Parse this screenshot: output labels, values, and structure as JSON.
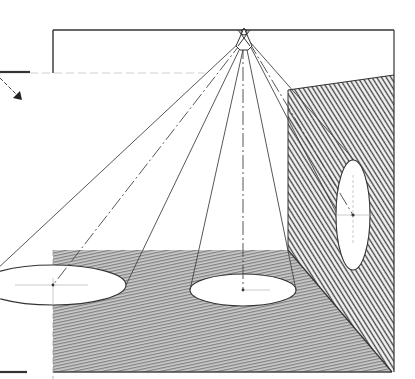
{
  "diagram": {
    "title": "Light cone projection onto floor and wall",
    "kind": "technical-illustration",
    "canvas": {
      "width": 415,
      "height": 379
    },
    "colors": {
      "background": "#ffffff",
      "line": "#3a3a3a",
      "hatch_floor": "#6a6a6a",
      "hatch_wall": "#4a4a4a",
      "spot": "#ffffff"
    },
    "light_source": {
      "x": 243,
      "y": 38,
      "label": ""
    },
    "frame": {
      "ceiling_y": 30,
      "left_x": 53,
      "right_x": 395,
      "ref_line_y": 73
    },
    "floor": {
      "polygon": [
        [
          53,
          250
        ],
        [
          290,
          250
        ],
        [
          392,
          372
        ],
        [
          53,
          372
        ]
      ]
    },
    "wall": {
      "polygon": [
        [
          288,
          90
        ],
        [
          394,
          75
        ],
        [
          394,
          372
        ],
        [
          392,
          372
        ],
        [
          288,
          250
        ]
      ]
    },
    "spots": [
      {
        "name": "floor-spot-left",
        "cx": 53,
        "cy": 285,
        "rx": 73,
        "ry": 20
      },
      {
        "name": "floor-spot-center",
        "cx": 243,
        "cy": 290,
        "rx": 53,
        "ry": 16
      },
      {
        "name": "wall-spot",
        "cx": 353,
        "cy": 215,
        "rx": 17,
        "ry": 55
      }
    ],
    "arrow": {
      "from": [
        0,
        78
      ],
      "to": [
        22,
        100
      ],
      "label": ""
    }
  }
}
